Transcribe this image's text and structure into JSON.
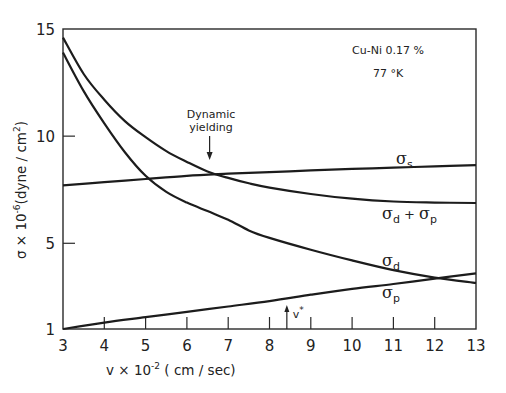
{
  "chart_data": {
    "type": "line",
    "title": "",
    "xlabel": "v x 10^-2 (cm/sec)",
    "ylabel": "σ x 10^-6 (dyne/cm²)",
    "xlim": [
      3,
      13
    ],
    "ylim": [
      1,
      15
    ],
    "grid": false,
    "x_ticks": [
      3,
      4,
      5,
      6,
      7,
      8,
      9,
      10,
      11,
      12,
      13
    ],
    "y_ticks": [
      1,
      5,
      10,
      15
    ],
    "annotations": {
      "material": "Cu-Ni  0.17 %",
      "temperature": "77 °K",
      "dynamic_yielding": [
        "Dynamic",
        "yielding"
      ],
      "dynamic_yielding_x": 6.55,
      "v_star_label": "v*",
      "v_star_x": 8.42
    },
    "series": [
      {
        "name": "σs",
        "label_main": "σ",
        "label_sub": "s",
        "x": [
          3,
          4,
          5,
          6,
          7,
          8,
          9,
          10,
          11,
          12,
          13
        ],
        "values": [
          7.7,
          7.85,
          8.0,
          8.15,
          8.25,
          8.32,
          8.4,
          8.47,
          8.53,
          8.59,
          8.65
        ]
      },
      {
        "name": "σd + σp",
        "label_main": "σ",
        "label_sub": "d",
        "label_plus": " + ",
        "label_main2": "σ",
        "label_sub2": "p",
        "x": [
          3,
          3.5,
          4,
          4.5,
          5,
          5.5,
          6,
          6.5,
          7,
          7.5,
          8,
          9,
          10,
          11,
          12,
          13
        ],
        "values": [
          14.6,
          12.9,
          11.7,
          10.7,
          9.95,
          9.3,
          8.8,
          8.35,
          8.05,
          7.8,
          7.6,
          7.3,
          7.08,
          6.95,
          6.9,
          6.88
        ]
      },
      {
        "name": "σd",
        "label_main": "σ",
        "label_sub": "d",
        "x": [
          3,
          3.5,
          4,
          4.5,
          5,
          5.5,
          6,
          6.5,
          7,
          7.5,
          8,
          9,
          10,
          11,
          12,
          13
        ],
        "values": [
          13.9,
          12.1,
          10.6,
          9.25,
          8.15,
          7.4,
          6.9,
          6.5,
          6.1,
          5.6,
          5.25,
          4.7,
          4.2,
          3.75,
          3.4,
          3.15
        ]
      },
      {
        "name": "σp",
        "label_main": "σ",
        "label_sub": "p",
        "x": [
          3,
          4,
          5,
          6,
          7,
          8,
          9,
          10,
          11,
          12,
          13
        ],
        "values": [
          1.0,
          1.3,
          1.55,
          1.8,
          2.05,
          2.3,
          2.6,
          2.87,
          3.1,
          3.35,
          3.6
        ]
      }
    ]
  }
}
